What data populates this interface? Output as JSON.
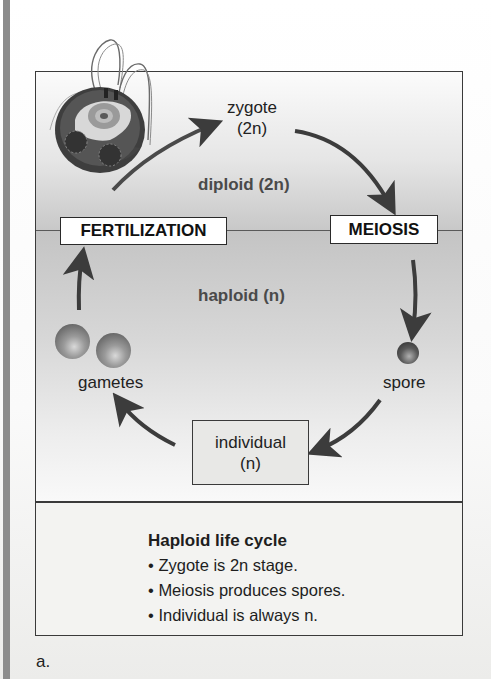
{
  "diagram": {
    "title": "Haploid life cycle",
    "zones": {
      "diploid": "diploid (2n)",
      "haploid": "haploid (n)"
    },
    "stages": {
      "fertilization": "FERTILIZATION",
      "meiosis": "MEIOSIS"
    },
    "nodes": {
      "zygote": {
        "name": "zygote",
        "ploidy": "(2n)"
      },
      "spore": "spore",
      "individual": {
        "name": "individual",
        "ploidy": "(n)"
      },
      "gametes": "gametes"
    },
    "cycle_order": [
      "zygote (2n)",
      "MEIOSIS",
      "spore",
      "individual (n)",
      "gametes",
      "FERTILIZATION",
      "zygote (2n)"
    ],
    "icons": {
      "cell": "algae-cell-illustration-icon",
      "gamete": "sphere-icon",
      "spore": "sphere-icon",
      "arrow": "curved-arrow-icon"
    }
  },
  "caption": {
    "heading": "Haploid life cycle",
    "bullets": [
      "Zygote is 2n stage.",
      "Meiosis produces spores.",
      "Individual is always n."
    ]
  },
  "panel_label": "a.",
  "colors": {
    "frame": "#3a3a3a",
    "diploid_bg": "#d8d8d8",
    "haploid_bg": "#d0d0d0",
    "arrow": "#3c3c3c",
    "left_bar": "#8c8c8c"
  }
}
